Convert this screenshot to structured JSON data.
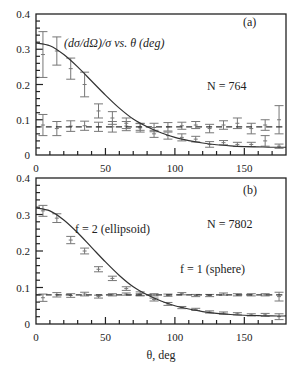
{
  "figure": {
    "xlabel": "θ, deg",
    "x_ticks": [
      0,
      50,
      100,
      150
    ],
    "y_ticks": [
      0,
      0.1,
      0.2,
      0.3,
      0.4
    ],
    "y_tick_labels": [
      "0",
      "0.1",
      "0.2",
      "0.3",
      "0.4"
    ],
    "x_tick_labels": [
      "0",
      "50",
      "100",
      "150"
    ]
  },
  "chart_data": [
    {
      "type": "scatter",
      "panel_label": "(a)",
      "title": "(dσ/dΩ)/σ vs. θ (deg)",
      "annotation": "N = 764",
      "xlabel": "",
      "ylabel": "",
      "xlim": [
        0,
        180
      ],
      "ylim": [
        0,
        0.4
      ],
      "grid": false,
      "series": [
        {
          "name": "ellipsoid data",
          "style": "errorbar",
          "x": [
            5,
            15,
            25,
            35,
            45,
            55,
            65,
            75,
            85,
            95,
            105,
            115,
            125,
            135,
            145,
            155,
            165,
            175
          ],
          "values": [
            0.285,
            0.295,
            0.245,
            0.2,
            0.125,
            0.105,
            0.09,
            0.077,
            0.06,
            0.055,
            0.05,
            0.045,
            0.03,
            0.035,
            0.03,
            0.03,
            0.04,
            0.025
          ],
          "errors": [
            0.065,
            0.04,
            0.03,
            0.035,
            0.02,
            0.018,
            0.015,
            0.012,
            0.01,
            0.01,
            0.01,
            0.008,
            0.008,
            0.006,
            0.006,
            0.006,
            0.015,
            0.006
          ]
        },
        {
          "name": "sphere data",
          "style": "errorbar",
          "x": [
            5,
            15,
            25,
            35,
            45,
            55,
            65,
            75,
            85,
            95,
            105,
            115,
            125,
            135,
            145,
            155,
            165,
            175
          ],
          "values": [
            0.085,
            0.075,
            0.082,
            0.083,
            0.08,
            0.08,
            0.082,
            0.08,
            0.078,
            0.08,
            0.083,
            0.085,
            0.075,
            0.085,
            0.09,
            0.075,
            0.085,
            0.1
          ],
          "errors": [
            0.03,
            0.02,
            0.015,
            0.013,
            0.013,
            0.015,
            0.013,
            0.01,
            0.012,
            0.012,
            0.01,
            0.01,
            0.012,
            0.012,
            0.015,
            0.015,
            0.015,
            0.04
          ]
        },
        {
          "name": "f = 2 (ellipsoid) model",
          "style": "solid",
          "x": [
            0,
            10,
            20,
            30,
            40,
            50,
            60,
            70,
            80,
            90,
            100,
            110,
            120,
            130,
            140,
            150,
            160,
            170,
            180
          ],
          "values": [
            0.318,
            0.31,
            0.285,
            0.25,
            0.21,
            0.17,
            0.133,
            0.102,
            0.08,
            0.063,
            0.05,
            0.041,
            0.034,
            0.029,
            0.026,
            0.024,
            0.023,
            0.022,
            0.022
          ]
        },
        {
          "name": "f = 1 (sphere) model",
          "style": "dashed",
          "x": [
            0,
            180
          ],
          "values": [
            0.0796,
            0.0796
          ]
        }
      ]
    },
    {
      "type": "scatter",
      "panel_label": "(b)",
      "annotation": "N = 7802",
      "labels": [
        "f = 2 (ellipsoid)",
        "f = 1 (sphere)"
      ],
      "xlabel": "θ, deg",
      "ylabel": "",
      "xlim": [
        0,
        180
      ],
      "ylim": [
        0,
        0.4
      ],
      "grid": false,
      "series": [
        {
          "name": "ellipsoid data",
          "style": "errorbar",
          "x": [
            5,
            15,
            25,
            35,
            45,
            55,
            65,
            75,
            85,
            95,
            105,
            115,
            125,
            135,
            145,
            155,
            165,
            175
          ],
          "values": [
            0.31,
            0.29,
            0.23,
            0.2,
            0.15,
            0.125,
            0.097,
            0.083,
            0.067,
            0.055,
            0.045,
            0.04,
            0.033,
            0.03,
            0.028,
            0.025,
            0.025,
            0.02
          ],
          "errors": [
            0.015,
            0.012,
            0.01,
            0.008,
            0.007,
            0.006,
            0.005,
            0.005,
            0.004,
            0.004,
            0.003,
            0.003,
            0.003,
            0.003,
            0.003,
            0.003,
            0.004,
            0.008
          ]
        },
        {
          "name": "sphere data",
          "style": "errorbar",
          "x": [
            5,
            15,
            25,
            35,
            45,
            55,
            65,
            75,
            85,
            95,
            105,
            115,
            125,
            135,
            145,
            155,
            165,
            175
          ],
          "values": [
            0.072,
            0.08,
            0.078,
            0.082,
            0.075,
            0.08,
            0.082,
            0.08,
            0.08,
            0.079,
            0.083,
            0.078,
            0.078,
            0.082,
            0.08,
            0.08,
            0.08,
            0.075
          ],
          "errors": [
            0.01,
            0.006,
            0.005,
            0.005,
            0.004,
            0.003,
            0.003,
            0.003,
            0.003,
            0.003,
            0.003,
            0.003,
            0.003,
            0.003,
            0.003,
            0.003,
            0.003,
            0.012
          ]
        },
        {
          "name": "f = 2 (ellipsoid) model",
          "style": "solid",
          "x": [
            0,
            10,
            20,
            30,
            40,
            50,
            60,
            70,
            80,
            90,
            100,
            110,
            120,
            130,
            140,
            150,
            160,
            170,
            180
          ],
          "values": [
            0.318,
            0.31,
            0.285,
            0.25,
            0.21,
            0.17,
            0.133,
            0.102,
            0.08,
            0.063,
            0.05,
            0.041,
            0.034,
            0.029,
            0.026,
            0.024,
            0.023,
            0.022,
            0.022
          ]
        },
        {
          "name": "f = 1 (sphere) model",
          "style": "dashed",
          "x": [
            0,
            180
          ],
          "values": [
            0.0796,
            0.0796
          ]
        }
      ]
    }
  ]
}
